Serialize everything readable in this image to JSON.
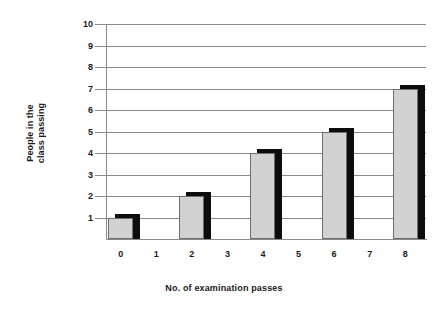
{
  "chart_data": {
    "type": "bar",
    "title": "",
    "xlabel": "No. of examination passes",
    "ylabel_line1": "People in the",
    "ylabel_line2": "class passing",
    "ylabel": "People in the class passing",
    "categories": [
      "0",
      "1",
      "2",
      "3",
      "4",
      "5",
      "6",
      "7",
      "8"
    ],
    "values": [
      1,
      2,
      4,
      5,
      7,
      6,
      3,
      1,
      1
    ],
    "yticks": [
      "1",
      "2",
      "3",
      "4",
      "5",
      "6",
      "7",
      "8",
      "9",
      "10"
    ],
    "ylim": [
      0,
      10
    ],
    "grid": true,
    "legend": false,
    "colors": {
      "bar_fill": "#d2d2d2",
      "bar_outline": "#6e6e6e",
      "bar_shadow": "#0d0d0d",
      "grid": "#8a8a8a",
      "axis": "#8a8a8a",
      "text": "#1a1a1a",
      "background": "#ffffff"
    }
  }
}
